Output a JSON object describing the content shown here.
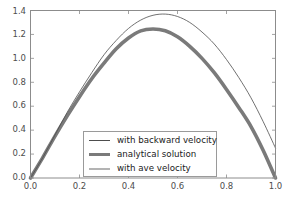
{
  "chart_data": {
    "type": "line",
    "title": "",
    "xlabel": "",
    "ylabel": "",
    "xlim": [
      0.0,
      1.0
    ],
    "ylim": [
      0.0,
      1.4
    ],
    "grid": false,
    "legend_position": "lower center",
    "xticks": [
      "0.0",
      "0.2",
      "0.4",
      "0.6",
      "0.8",
      "1.0"
    ],
    "xtick_values": [
      0.0,
      0.2,
      0.4,
      0.6,
      0.8,
      1.0
    ],
    "yticks": [
      "0.0",
      "0.2",
      "0.4",
      "0.6",
      "0.8",
      "1.0",
      "1.2",
      "1.4"
    ],
    "ytick_values": [
      0.0,
      0.2,
      0.4,
      0.6,
      0.8,
      1.0,
      1.2,
      1.4
    ],
    "x": [
      0.0,
      0.05,
      0.1,
      0.15,
      0.2,
      0.25,
      0.3,
      0.35,
      0.4,
      0.45,
      0.5,
      0.55,
      0.6,
      0.65,
      0.7,
      0.75,
      0.8,
      0.85,
      0.9,
      0.95,
      1.0
    ],
    "series": [
      {
        "name": "with backward velocity",
        "color": "#4d4d4d",
        "linewidth": 0.8,
        "values": [
          0.0,
          0.17,
          0.36,
          0.55,
          0.72,
          0.88,
          1.03,
          1.15,
          1.25,
          1.32,
          1.36,
          1.37,
          1.35,
          1.3,
          1.22,
          1.12,
          0.99,
          0.84,
          0.67,
          0.47,
          0.25
        ]
      },
      {
        "name": "analytical solution",
        "color": "#7a7a7a",
        "linewidth": 3.6,
        "values": [
          0.0,
          0.17,
          0.35,
          0.52,
          0.68,
          0.83,
          0.96,
          1.08,
          1.17,
          1.23,
          1.245,
          1.23,
          1.18,
          1.1,
          1.0,
          0.88,
          0.74,
          0.59,
          0.43,
          0.23,
          0.0
        ]
      },
      {
        "name": "with ave velocity",
        "color": "#b3b3b3",
        "linewidth": 2.0,
        "values": [
          0.0,
          0.17,
          0.35,
          0.52,
          0.68,
          0.83,
          0.96,
          1.08,
          1.17,
          1.23,
          1.245,
          1.23,
          1.18,
          1.1,
          1.0,
          0.88,
          0.74,
          0.59,
          0.43,
          0.23,
          0.0
        ]
      }
    ]
  },
  "axes": {
    "frame_color": "#8c8c8c",
    "tick_color": "#8c8c8c",
    "background": "#ffffff"
  },
  "legend": {
    "entries": [
      {
        "label": "with backward velocity"
      },
      {
        "label": "analytical solution"
      },
      {
        "label": "with ave velocity"
      }
    ]
  }
}
